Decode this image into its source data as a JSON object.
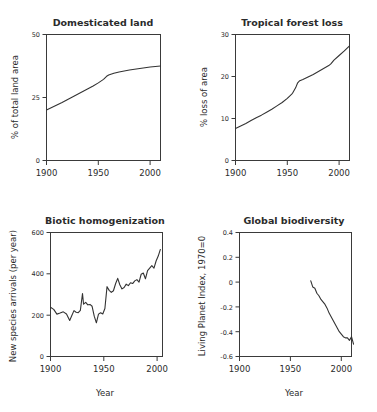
{
  "figure": {
    "name": "four-panel-environmental-indicators"
  },
  "chart_data": [
    {
      "panel": "top-left",
      "type": "line",
      "title": "Domesticated land",
      "xlabel": "",
      "ylabel": "% of total land area",
      "xlim": [
        1900,
        2010
      ],
      "ylim": [
        0,
        50
      ],
      "xticks": [
        1900,
        1950,
        2000
      ],
      "xticklabels": [
        "1900",
        "1950",
        "2000"
      ],
      "yticks": [
        0,
        25,
        50
      ],
      "yticklabels": [
        "0",
        "25",
        "50"
      ],
      "grid": false,
      "legend": "none",
      "x": [
        1900,
        1905,
        1910,
        1915,
        1920,
        1925,
        1930,
        1935,
        1940,
        1945,
        1950,
        1955,
        1958,
        1960,
        1965,
        1970,
        1975,
        1980,
        1985,
        1990,
        1995,
        2000,
        2005,
        2010
      ],
      "values": [
        20.0,
        21.0,
        22.0,
        23.0,
        24.1,
        25.2,
        26.3,
        27.4,
        28.5,
        29.6,
        30.8,
        32.2,
        33.4,
        33.9,
        34.6,
        35.1,
        35.5,
        35.9,
        36.2,
        36.5,
        36.8,
        37.1,
        37.3,
        37.5
      ]
    },
    {
      "panel": "top-right",
      "type": "line",
      "title": "Tropical forest loss",
      "xlabel": "",
      "ylabel": "% loss of area",
      "xlim": [
        1900,
        2010
      ],
      "ylim": [
        0,
        30
      ],
      "xticks": [
        1900,
        1950,
        2000
      ],
      "xticklabels": [
        "1900",
        "1950",
        "2000"
      ],
      "yticks": [
        0,
        10,
        20,
        30
      ],
      "yticklabels": [
        "0",
        "10",
        "20",
        "30"
      ],
      "grid": false,
      "legend": "none",
      "x": [
        1900,
        1905,
        1910,
        1915,
        1920,
        1925,
        1930,
        1935,
        1940,
        1945,
        1950,
        1955,
        1958,
        1960,
        1962,
        1965,
        1970,
        1975,
        1980,
        1985,
        1990,
        1992,
        1995,
        2000,
        2005,
        2010
      ],
      "values": [
        7.6,
        8.2,
        8.8,
        9.5,
        10.2,
        10.8,
        11.5,
        12.2,
        13.0,
        13.8,
        14.8,
        16.0,
        17.3,
        18.5,
        19.0,
        19.3,
        19.9,
        20.5,
        21.2,
        21.9,
        22.6,
        23.0,
        23.9,
        25.0,
        26.1,
        27.3
      ]
    },
    {
      "panel": "bottom-left",
      "type": "line",
      "title": "Biotic homogenization",
      "xlabel": "Year",
      "ylabel": "New species arrivals (per year)",
      "xlim": [
        1900,
        2005
      ],
      "ylim": [
        0,
        600
      ],
      "xticks": [
        1900,
        1950,
        2000
      ],
      "xticklabels": [
        "1900",
        "1950",
        "2000"
      ],
      "yticks": [
        0,
        200,
        400,
        600
      ],
      "yticklabels": [
        "0",
        "200",
        "400",
        "600"
      ],
      "grid": false,
      "legend": "none",
      "x": [
        1900,
        1903,
        1906,
        1909,
        1912,
        1915,
        1918,
        1920,
        1922,
        1924,
        1926,
        1928,
        1930,
        1931,
        1933,
        1935,
        1937,
        1939,
        1941,
        1943,
        1945,
        1947,
        1949,
        1951,
        1953,
        1955,
        1957,
        1959,
        1961,
        1963,
        1965,
        1967,
        1969,
        1971,
        1973,
        1975,
        1977,
        1979,
        1981,
        1983,
        1985,
        1987,
        1989,
        1991,
        1993,
        1995,
        1997,
        1999,
        2001,
        2003
      ],
      "values": [
        238,
        228,
        205,
        210,
        216,
        206,
        174,
        198,
        222,
        214,
        212,
        223,
        305,
        253,
        262,
        250,
        252,
        243,
        195,
        163,
        205,
        212,
        206,
        232,
        338,
        320,
        310,
        318,
        352,
        378,
        347,
        327,
        334,
        350,
        343,
        357,
        353,
        366,
        372,
        360,
        398,
        404,
        376,
        416,
        428,
        440,
        428,
        462,
        486,
        518
      ]
    },
    {
      "panel": "bottom-right",
      "type": "line",
      "title": "Global biodiversity",
      "xlabel": "Year",
      "ylabel": "Living Planet Index, 1970=0",
      "xlim": [
        1900,
        2010
      ],
      "ylim": [
        -0.6,
        0.4
      ],
      "xticks": [
        1900,
        1950,
        2000
      ],
      "xticklabels": [
        "1900",
        "1950",
        "2000"
      ],
      "yticks": [
        -0.6,
        -0.4,
        -0.2,
        0,
        0.2,
        0.4
      ],
      "yticklabels": [
        "-0.6",
        "-0.4",
        "-0.2",
        "0",
        "0.2",
        "0.4"
      ],
      "grid": false,
      "legend": "none",
      "x": [
        1970,
        1972,
        1974,
        1976,
        1978,
        1980,
        1982,
        1984,
        1986,
        1988,
        1990,
        1992,
        1994,
        1996,
        1998,
        2000,
        2002,
        2004,
        2006,
        2008,
        2010,
        2012
      ],
      "values": [
        0.01,
        -0.04,
        -0.05,
        -0.09,
        -0.11,
        -0.14,
        -0.16,
        -0.18,
        -0.21,
        -0.25,
        -0.28,
        -0.31,
        -0.34,
        -0.37,
        -0.4,
        -0.42,
        -0.44,
        -0.45,
        -0.45,
        -0.47,
        -0.44,
        -0.5
      ]
    }
  ]
}
